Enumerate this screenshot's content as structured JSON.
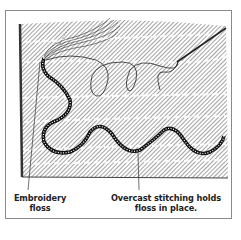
{
  "figure": {
    "colors": {
      "ink": "#222222",
      "hatch": "#555555",
      "frame": "#8a8a8a",
      "background": "#ffffff"
    }
  },
  "labels": {
    "embroidery_floss_line1": "Embroidery",
    "embroidery_floss_line2": "floss",
    "overcast_line1": "Overcast stitching holds",
    "overcast_line2": "floss in place."
  }
}
